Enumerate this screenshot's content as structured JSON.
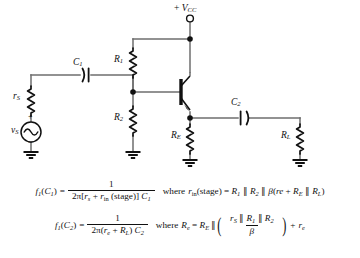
{
  "diagram": {
    "type": "schematic",
    "supply": {
      "label_sign": "+",
      "label_symbol": "V",
      "label_subscript": "CC",
      "terminal": "open-circle"
    },
    "components": [
      {
        "id": "rs",
        "type": "resistor",
        "label": "r",
        "sub": "S",
        "name": "source-resistance"
      },
      {
        "id": "vs",
        "type": "ac-source",
        "label": "v",
        "sub": "S",
        "name": "signal-source",
        "plus": "+",
        "minus": "−"
      },
      {
        "id": "c1",
        "type": "capacitor",
        "label": "C",
        "sub": "1",
        "name": "input-coupling-capacitor"
      },
      {
        "id": "r1",
        "type": "resistor",
        "label": "R",
        "sub": "1",
        "name": "bias-resistor-upper"
      },
      {
        "id": "r2",
        "type": "resistor",
        "label": "R",
        "sub": "2",
        "name": "bias-resistor-lower"
      },
      {
        "id": "q1",
        "type": "npn-transistor",
        "label": "",
        "sub": "",
        "name": "npn-transistor"
      },
      {
        "id": "re",
        "type": "resistor",
        "label": "R",
        "sub": "E",
        "name": "emitter-resistor"
      },
      {
        "id": "c2",
        "type": "capacitor",
        "label": "C",
        "sub": "2",
        "name": "output-coupling-capacitor"
      },
      {
        "id": "rl",
        "type": "resistor",
        "label": "R",
        "sub": "L",
        "name": "load-resistor"
      }
    ],
    "ground_count": 4
  },
  "equations": [
    {
      "id": "eq1",
      "lhs_f": "f",
      "lhs_fsub": "1",
      "lhs_arg": "C",
      "lhs_argsub": "1",
      "equals": "=",
      "numerator": "1",
      "den_coef": "2π[",
      "den_r": "r",
      "den_rsub": "s",
      "den_plus": "+",
      "den_rin": "r",
      "den_rinsub": "in",
      "den_stage": "(stage)]",
      "den_cap": "C",
      "den_capsub": "1",
      "where": "where",
      "rhs_r": "r",
      "rhs_rsub": "in",
      "rhs_stage": "(stage)",
      "rhs_equals": "=",
      "rhs_expr_R1": "R",
      "rhs_expr_R1sub": "1",
      "par1": "∥",
      "rhs_expr_R2": "R",
      "rhs_expr_R2sub": "2",
      "par2": "∥",
      "beta": "β",
      "open": "(",
      "re_text": "re",
      "plus2": "+",
      "RE": "R",
      "REsub": "E",
      "par3": "∥",
      "RL": "R",
      "RLsub": "L",
      "close": ")"
    },
    {
      "id": "eq2",
      "lhs_f": "f",
      "lhs_fsub": "1",
      "lhs_arg": "C",
      "lhs_argsub": "2",
      "equals": "=",
      "numerator": "1",
      "den_coef": "2π(",
      "den_re": "r",
      "den_resub": "e",
      "den_plus": "+",
      "den_RL": "R",
      "den_RLsub": "L",
      "den_closecoef": ")",
      "den_cap": "C",
      "den_capsub": "2",
      "where": "where",
      "rhs_Re": "R",
      "rhs_Resub": "e",
      "rhs_equals": "=",
      "rhs_RE": "R",
      "rhs_REsub": "E",
      "par1": "∥",
      "inner_rS": "r",
      "inner_rSsub": "S",
      "par2": "∥",
      "inner_R1": "R",
      "inner_R1sub": "1",
      "par3": "∥",
      "inner_R2": "R",
      "inner_R2sub": "2",
      "inner_den_beta": "β",
      "plus2": "+",
      "tail_re": "r",
      "tail_resub": "e"
    }
  ],
  "colors": {
    "background": "#ffffff",
    "wire": "#6e6e6e",
    "ink": "#111111",
    "node": "#111111"
  }
}
